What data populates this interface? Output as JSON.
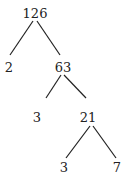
{
  "diagram": {
    "type": "factor-tree",
    "nodes": [
      {
        "id": "n126",
        "label": "126"
      },
      {
        "id": "n2",
        "label": "2"
      },
      {
        "id": "n63",
        "label": "63"
      },
      {
        "id": "n3a",
        "label": "3"
      },
      {
        "id": "n21",
        "label": "21"
      },
      {
        "id": "n3b",
        "label": "3"
      },
      {
        "id": "n7",
        "label": "7"
      }
    ],
    "edges": [
      [
        "n126",
        "n2"
      ],
      [
        "n126",
        "n63"
      ],
      [
        "n63",
        "n3a"
      ],
      [
        "n63",
        "n21"
      ],
      [
        "n21",
        "n3b"
      ],
      [
        "n21",
        "n7"
      ]
    ]
  }
}
